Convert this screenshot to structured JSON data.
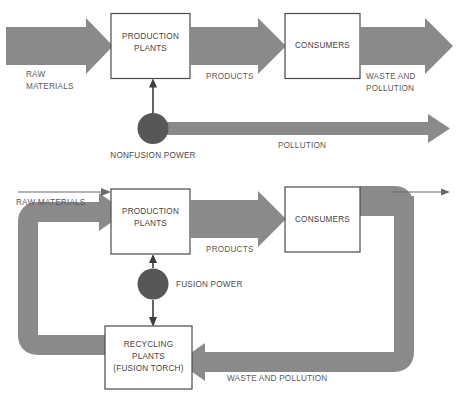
{
  "figure": {
    "title": "",
    "colors": {
      "arrow_gray": "#8a8a8a",
      "circle_gray": "#575757",
      "box_stroke": "#4a4a4a",
      "box_fill": "#ffffff",
      "text": "#4a4a4a",
      "background": "#ffffff"
    }
  },
  "diagrams": [
    {
      "id": "nonfusion-economy",
      "name": "Nonfusion economy (linear flow)",
      "nodes": [
        {
          "id": "production-plants",
          "label_lines": [
            "PRODUCTION",
            "PLANTS"
          ],
          "shape": "box"
        },
        {
          "id": "consumers",
          "label_lines": [
            "CONSUMERS"
          ],
          "shape": "box"
        },
        {
          "id": "nonfusion-power",
          "label_lines": [
            "NONFUSION POWER"
          ],
          "shape": "circle"
        }
      ],
      "flows": [
        {
          "id": "raw-materials",
          "label_lines": [
            "RAW",
            "MATERIALS"
          ],
          "style": "thick-arrow"
        },
        {
          "id": "products",
          "label_lines": [
            "PRODUCTS"
          ],
          "style": "thick-arrow"
        },
        {
          "id": "waste-and-pollution",
          "label_lines": [
            "WASTE AND",
            "POLLUTION"
          ],
          "style": "thick-arrow"
        },
        {
          "id": "pollution",
          "label_lines": [
            "POLLUTION"
          ],
          "style": "thin-band-arrow"
        },
        {
          "id": "power-feed",
          "label_lines": [],
          "style": "line-arrow"
        }
      ]
    },
    {
      "id": "fusion-economy",
      "name": "Fusion economy (closed recycling loop)",
      "nodes": [
        {
          "id": "production-plants",
          "label_lines": [
            "PRODUCTION",
            "PLANTS"
          ],
          "shape": "box"
        },
        {
          "id": "consumers",
          "label_lines": [
            "CONSUMERS"
          ],
          "shape": "box"
        },
        {
          "id": "recycling-plants",
          "label_lines": [
            "RECYCLING",
            "PLANTS",
            "(FUSION TORCH)"
          ],
          "shape": "box"
        },
        {
          "id": "fusion-power",
          "label_lines": [
            "FUSION POWER"
          ],
          "shape": "circle"
        }
      ],
      "flows": [
        {
          "id": "raw-materials",
          "label_lines": [
            "RAW MATERIALS"
          ],
          "style": "line-arrow"
        },
        {
          "id": "products",
          "label_lines": [
            "PRODUCTS"
          ],
          "style": "thick-arrow"
        },
        {
          "id": "waste-and-pollution",
          "label_lines": [
            "WASTE AND POLLUTION"
          ],
          "style": "thick-loop-arrow"
        },
        {
          "id": "recycled-materials",
          "label_lines": [],
          "style": "thick-loop-arrow"
        },
        {
          "id": "residual-output",
          "label_lines": [],
          "style": "line-arrow"
        },
        {
          "id": "power-feed-up",
          "label_lines": [],
          "style": "line-arrow"
        },
        {
          "id": "power-feed-down",
          "label_lines": [],
          "style": "line-arrow"
        }
      ]
    }
  ],
  "labels": {
    "top": {
      "production_plants_l1": "PRODUCTION",
      "production_plants_l2": "PLANTS",
      "consumers": "CONSUMERS",
      "raw_materials_l1": "RAW",
      "raw_materials_l2": "MATERIALS",
      "products": "PRODUCTS",
      "waste_l1": "WASTE AND",
      "waste_l2": "POLLUTION",
      "nonfusion_power": "NONFUSION POWER",
      "pollution": "POLLUTION"
    },
    "bottom": {
      "raw_materials": "RAW MATERIALS",
      "production_plants_l1": "PRODUCTION",
      "production_plants_l2": "PLANTS",
      "consumers": "CONSUMERS",
      "products": "PRODUCTS",
      "fusion_power": "FUSION POWER",
      "recycling_l1": "RECYCLING",
      "recycling_l2": "PLANTS",
      "recycling_l3": "(FUSION TORCH)",
      "waste_and_pollution": "WASTE AND POLLUTION"
    }
  }
}
